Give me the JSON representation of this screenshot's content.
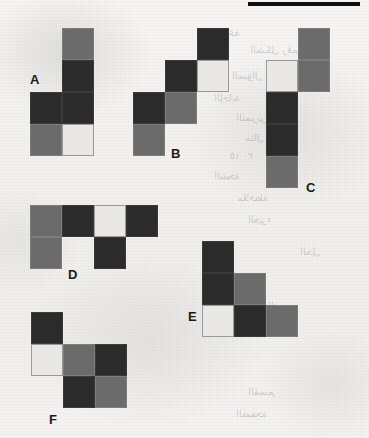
{
  "page": {
    "background_color": "#f2f1ef",
    "width": 369,
    "height": 438,
    "top_bar_color": "#111111"
  },
  "palette": {
    "dark": "#2b2b2b",
    "mid": "#6b6b6b",
    "light": "#e9e8e4"
  },
  "ghost_text": [
    {
      "text": "المجموعة",
      "x": 196,
      "y": 26,
      "size": 11
    },
    {
      "text": "الشكل رقم",
      "x": 250,
      "y": 44,
      "size": 10
    },
    {
      "text": "السؤال",
      "x": 232,
      "y": 70,
      "size": 10
    },
    {
      "text": "الإجابة",
      "x": 214,
      "y": 92,
      "size": 10
    },
    {
      "text": "التمرين",
      "x": 236,
      "y": 112,
      "size": 10
    },
    {
      "text": "مثال ١",
      "x": 246,
      "y": 132,
      "size": 10
    },
    {
      "text": "١٥ ٢٠",
      "x": 230,
      "y": 150,
      "size": 10
    },
    {
      "text": "النتيجة",
      "x": 214,
      "y": 170,
      "size": 10
    },
    {
      "text": "ملاحظة",
      "x": 238,
      "y": 192,
      "size": 10
    },
    {
      "text": "الجزء",
      "x": 248,
      "y": 214,
      "size": 10
    },
    {
      "text": "الحل",
      "x": 300,
      "y": 246,
      "size": 10
    },
    {
      "text": "الرسم",
      "x": 268,
      "y": 300,
      "size": 10
    },
    {
      "text": "القسم",
      "x": 248,
      "y": 386,
      "size": 10
    },
    {
      "text": "الصفحة",
      "x": 236,
      "y": 408,
      "size": 10
    }
  ],
  "top_bar": {
    "x": 248,
    "y": 2,
    "width": 112,
    "height": 4
  },
  "cell_size": 32,
  "shapes": [
    {
      "id": "A",
      "name": "shape-a",
      "origin": {
        "x": 30,
        "y": 28
      },
      "label": {
        "text": "A",
        "x": 0,
        "y": 44
      },
      "cells": [
        {
          "col": 1,
          "row": 0,
          "color": "mid"
        },
        {
          "col": 1,
          "row": 1,
          "color": "dark"
        },
        {
          "col": 0,
          "row": 2,
          "color": "dark"
        },
        {
          "col": 1,
          "row": 2,
          "color": "dark"
        },
        {
          "col": 0,
          "row": 3,
          "color": "mid"
        },
        {
          "col": 1,
          "row": 3,
          "color": "light"
        }
      ]
    },
    {
      "id": "B",
      "name": "shape-b",
      "origin": {
        "x": 133,
        "y": 28
      },
      "label": {
        "text": "B",
        "x": 38,
        "y": 118
      },
      "cells": [
        {
          "col": 2,
          "row": 0,
          "color": "dark"
        },
        {
          "col": 1,
          "row": 1,
          "color": "dark"
        },
        {
          "col": 2,
          "row": 1,
          "color": "light"
        },
        {
          "col": 0,
          "row": 2,
          "color": "dark"
        },
        {
          "col": 1,
          "row": 2,
          "color": "mid"
        },
        {
          "col": 0,
          "row": 3,
          "color": "mid"
        }
      ]
    },
    {
      "id": "C",
      "name": "shape-c",
      "origin": {
        "x": 266,
        "y": 28
      },
      "label": {
        "text": "C",
        "x": 40,
        "y": 152
      },
      "cells": [
        {
          "col": 1,
          "row": 0,
          "color": "mid"
        },
        {
          "col": 0,
          "row": 1,
          "color": "light"
        },
        {
          "col": 1,
          "row": 1,
          "color": "mid"
        },
        {
          "col": 0,
          "row": 2,
          "color": "dark"
        },
        {
          "col": 0,
          "row": 3,
          "color": "dark"
        },
        {
          "col": 0,
          "row": 4,
          "color": "mid"
        }
      ]
    },
    {
      "id": "D",
      "name": "shape-d",
      "origin": {
        "x": 30,
        "y": 205
      },
      "label": {
        "text": "D",
        "x": 38,
        "y": 62
      },
      "cells": [
        {
          "col": 0,
          "row": 0,
          "color": "mid"
        },
        {
          "col": 1,
          "row": 0,
          "color": "dark"
        },
        {
          "col": 2,
          "row": 0,
          "color": "light"
        },
        {
          "col": 3,
          "row": 0,
          "color": "dark"
        },
        {
          "col": 0,
          "row": 1,
          "color": "mid"
        },
        {
          "col": 2,
          "row": 1,
          "color": "dark"
        }
      ]
    },
    {
      "id": "E",
      "name": "shape-e",
      "origin": {
        "x": 202,
        "y": 241
      },
      "label": {
        "text": "E",
        "x": -14,
        "y": 68
      },
      "cells": [
        {
          "col": 0,
          "row": 0,
          "color": "dark"
        },
        {
          "col": 0,
          "row": 1,
          "color": "dark"
        },
        {
          "col": 1,
          "row": 1,
          "color": "mid"
        },
        {
          "col": 0,
          "row": 2,
          "color": "light"
        },
        {
          "col": 1,
          "row": 2,
          "color": "dark"
        },
        {
          "col": 2,
          "row": 2,
          "color": "mid"
        }
      ]
    },
    {
      "id": "F",
      "name": "shape-f",
      "origin": {
        "x": 31,
        "y": 312
      },
      "label": {
        "text": "F",
        "x": 18,
        "y": 100
      },
      "cells": [
        {
          "col": 0,
          "row": 0,
          "color": "dark"
        },
        {
          "col": 0,
          "row": 1,
          "color": "light"
        },
        {
          "col": 1,
          "row": 1,
          "color": "mid"
        },
        {
          "col": 2,
          "row": 1,
          "color": "dark"
        },
        {
          "col": 1,
          "row": 2,
          "color": "dark"
        },
        {
          "col": 2,
          "row": 2,
          "color": "mid"
        }
      ]
    }
  ]
}
